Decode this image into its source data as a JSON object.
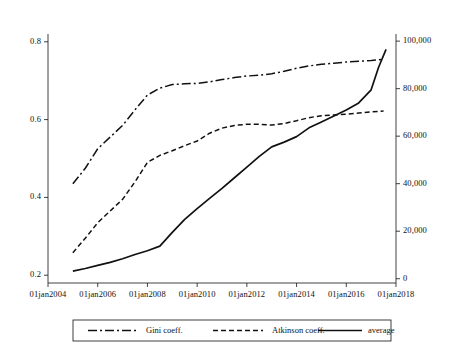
{
  "chart_data": {
    "type": "line",
    "title": "",
    "subtitle": "",
    "xlabel": "",
    "ylabel": "",
    "grid": false,
    "legend_position": "bottom",
    "x_tick_labels": [
      "01jan2004",
      "01jan2006",
      "01jan2008",
      "01jan2010",
      "01jan2012",
      "01jan2014",
      "01jan2016",
      "01jan2018"
    ],
    "x_tick_values": [
      2004,
      2006,
      2008,
      2010,
      2012,
      2014,
      2016,
      2018
    ],
    "xlim": [
      2004,
      2018
    ],
    "y_left_tick_labels": [
      "0.2",
      "0.4",
      "0.6",
      "0.8"
    ],
    "y_left_tick_values": [
      0.2,
      0.4,
      0.6,
      0.8
    ],
    "ylim_left": [
      0.18,
      0.82
    ],
    "y_right_tick_labels": [
      "0",
      "20,000",
      "40,000",
      "60,000",
      "80,000",
      "100,000"
    ],
    "y_right_tick_values": [
      0,
      20000,
      40000,
      60000,
      80000,
      100000
    ],
    "ylim_right": [
      -1800,
      103000
    ],
    "series": [
      {
        "name": "Gini coeff.",
        "axis": "left",
        "style": "dash-dot",
        "color": "#111111",
        "x": [
          2005.0,
          2005.5,
          2006.0,
          2006.5,
          2007.0,
          2007.5,
          2008.0,
          2008.5,
          2009.0,
          2009.5,
          2010.0,
          2010.5,
          2011.0,
          2011.5,
          2012.0,
          2012.5,
          2013.0,
          2013.5,
          2014.0,
          2014.5,
          2015.0,
          2015.5,
          2016.0,
          2016.5,
          2017.0,
          2017.5
        ],
        "values": [
          0.435,
          0.475,
          0.525,
          0.555,
          0.585,
          0.625,
          0.663,
          0.681,
          0.69,
          0.692,
          0.693,
          0.697,
          0.703,
          0.708,
          0.712,
          0.714,
          0.718,
          0.724,
          0.732,
          0.738,
          0.742,
          0.745,
          0.748,
          0.75,
          0.752,
          0.755
        ]
      },
      {
        "name": "Atkinson coeff.",
        "axis": "left",
        "style": "dashed",
        "color": "#111111",
        "x": [
          2005.0,
          2005.5,
          2006.0,
          2006.5,
          2007.0,
          2007.5,
          2008.0,
          2008.5,
          2009.0,
          2009.5,
          2010.0,
          2010.5,
          2011.0,
          2011.5,
          2012.0,
          2012.5,
          2013.0,
          2013.5,
          2014.0,
          2014.5,
          2015.0,
          2015.5,
          2016.0,
          2016.5,
          2017.0,
          2017.5
        ],
        "values": [
          0.258,
          0.295,
          0.335,
          0.365,
          0.395,
          0.44,
          0.49,
          0.508,
          0.52,
          0.533,
          0.545,
          0.565,
          0.578,
          0.585,
          0.588,
          0.588,
          0.586,
          0.59,
          0.597,
          0.605,
          0.61,
          0.612,
          0.614,
          0.617,
          0.62,
          0.622
        ]
      },
      {
        "name": "average",
        "axis": "right",
        "style": "solid",
        "color": "#111111",
        "x": [
          2005.0,
          2005.5,
          2006.0,
          2006.5,
          2007.0,
          2007.5,
          2008.0,
          2008.5,
          2009.0,
          2009.5,
          2010.0,
          2010.5,
          2011.0,
          2011.5,
          2012.0,
          2012.5,
          2013.0,
          2013.5,
          2014.0,
          2014.5,
          2015.0,
          2015.5,
          2016.0,
          2016.5,
          2017.0,
          2017.3,
          2017.6
        ],
        "values": [
          3200,
          4300,
          5600,
          6900,
          8400,
          10200,
          11800,
          13700,
          19500,
          25000,
          29500,
          33800,
          38000,
          42500,
          47000,
          51500,
          55500,
          57500,
          59800,
          63500,
          66000,
          68500,
          71000,
          74000,
          79500,
          89000,
          96500
        ]
      }
    ],
    "legend": [
      {
        "label": "Gini coeff.",
        "style": "dash-dot"
      },
      {
        "label": "Atkinson coeff.",
        "style": "dashed"
      },
      {
        "label": "average",
        "style": "solid"
      }
    ]
  }
}
